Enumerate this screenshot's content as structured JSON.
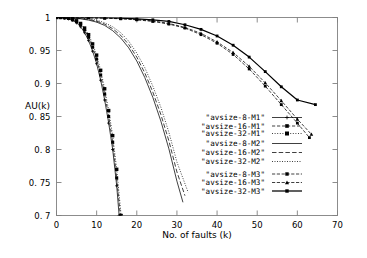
{
  "chart_data": {
    "type": "line",
    "title": "",
    "xlabel": "No. of faults (k)",
    "ylabel": "AU(k)",
    "xlim": [
      0,
      70
    ],
    "ylim": [
      0.7,
      1
    ],
    "xticks": [
      0,
      10,
      20,
      30,
      40,
      50,
      60,
      70
    ],
    "xtick_labels": [
      "0",
      "10",
      "20",
      "30",
      "40",
      "50",
      "60",
      "70"
    ],
    "yticks": [
      0.7,
      0.75,
      0.8,
      0.85,
      0.9,
      0.95,
      1
    ],
    "ytick_labels": [
      "0. 7",
      "0. 75",
      "0. 8",
      "0. 85",
      "0. 9",
      "0. 95",
      "1"
    ],
    "grid": false,
    "legend_position": "inside right-center",
    "series": [
      {
        "name": "\"avsize-8-M1\"",
        "style": "solid-thin-plus",
        "x": [
          0,
          1,
          2,
          3,
          4,
          5,
          6,
          7,
          8,
          9,
          10,
          11,
          12,
          13,
          14,
          15,
          15.6
        ],
        "y": [
          1.0,
          1.0,
          0.999,
          0.998,
          0.996,
          0.992,
          0.986,
          0.977,
          0.965,
          0.949,
          0.93,
          0.905,
          0.875,
          0.84,
          0.8,
          0.745,
          0.7
        ]
      },
      {
        "name": "\"avsize-16-M1\"",
        "style": "dashed-marker-square",
        "x": [
          0,
          1,
          2,
          3,
          4,
          5,
          6,
          7,
          8,
          9,
          10,
          11,
          12,
          13,
          14,
          15,
          15.9
        ],
        "y": [
          1.0,
          1.0,
          0.9995,
          0.9985,
          0.9965,
          0.9935,
          0.989,
          0.981,
          0.97,
          0.955,
          0.937,
          0.913,
          0.884,
          0.85,
          0.811,
          0.757,
          0.7
        ]
      },
      {
        "name": "\"avsize-32-M1\"",
        "style": "dotted-marker-square",
        "x": [
          0,
          1,
          2,
          3,
          4,
          5,
          6,
          7,
          8,
          9,
          10,
          11,
          12,
          13,
          14,
          15,
          16.1
        ],
        "y": [
          1.0,
          1.0,
          1.0,
          0.999,
          0.997,
          0.995,
          0.991,
          0.984,
          0.974,
          0.96,
          0.943,
          0.92,
          0.892,
          0.859,
          0.821,
          0.77,
          0.7
        ]
      },
      {
        "name": "\"avsize-8-M2\"",
        "style": "solid-thin",
        "x": [
          0,
          2,
          4,
          6,
          8,
          10,
          12,
          14,
          16,
          18,
          20,
          22,
          24,
          26,
          28,
          30,
          31.5
        ],
        "y": [
          1.0,
          1.0,
          0.999,
          0.998,
          0.996,
          0.993,
          0.988,
          0.98,
          0.969,
          0.954,
          0.934,
          0.909,
          0.879,
          0.843,
          0.801,
          0.752,
          0.72
        ]
      },
      {
        "name": "\"avsize-16-M2\"",
        "style": "dashed-long",
        "x": [
          0,
          2,
          4,
          6,
          8,
          10,
          12,
          14,
          16,
          18,
          20,
          22,
          24,
          26,
          28,
          30,
          32
        ],
        "y": [
          1.0,
          1.0,
          0.9995,
          0.9985,
          0.997,
          0.9945,
          0.99,
          0.983,
          0.973,
          0.959,
          0.94,
          0.916,
          0.887,
          0.853,
          0.813,
          0.766,
          0.73
        ]
      },
      {
        "name": "\"avsize-32-M2\"",
        "style": "dotted-fine",
        "x": [
          0,
          2,
          4,
          6,
          8,
          10,
          12,
          14,
          16,
          18,
          20,
          22,
          24,
          26,
          28,
          30,
          32.8
        ],
        "y": [
          1.0,
          1.0,
          1.0,
          0.999,
          0.998,
          0.996,
          0.992,
          0.986,
          0.977,
          0.964,
          0.946,
          0.924,
          0.896,
          0.864,
          0.826,
          0.781,
          0.735
        ]
      },
      {
        "name": "\"avsize-8-M3\"",
        "style": "dash-dot-marker",
        "x": [
          0,
          4,
          8,
          12,
          16,
          20,
          24,
          28,
          32,
          36,
          40,
          44,
          48,
          52,
          56,
          60,
          63
        ],
        "y": [
          1.0,
          1.0,
          0.9995,
          0.999,
          0.998,
          0.9965,
          0.994,
          0.99,
          0.984,
          0.974,
          0.961,
          0.944,
          0.922,
          0.896,
          0.868,
          0.84,
          0.818
        ]
      },
      {
        "name": "\"avsize-16-M3\"",
        "style": "dash-dot-marker-tri",
        "x": [
          0,
          4,
          8,
          12,
          16,
          20,
          24,
          28,
          32,
          36,
          40,
          44,
          48,
          52,
          56,
          60,
          63.5
        ],
        "y": [
          1.0,
          1.0,
          1.0,
          0.9993,
          0.9985,
          0.997,
          0.995,
          0.991,
          0.985,
          0.976,
          0.963,
          0.947,
          0.926,
          0.901,
          0.874,
          0.846,
          0.823
        ]
      },
      {
        "name": "\"avsize-32-M3\"",
        "style": "solid-thick-marker",
        "x": [
          0,
          4,
          8,
          12,
          16,
          20,
          24,
          28,
          32,
          36,
          40,
          44,
          48,
          52,
          56,
          60,
          64.5
        ],
        "y": [
          1.0,
          1.0,
          1.0,
          0.9997,
          0.999,
          0.998,
          0.9965,
          0.994,
          0.989,
          0.982,
          0.972,
          0.958,
          0.94,
          0.918,
          0.895,
          0.875,
          0.868
        ]
      }
    ]
  },
  "legend": {
    "entries": [
      {
        "label": "\"avsize-8-M1\""
      },
      {
        "label": "\"avsize-16-M1\""
      },
      {
        "label": "\"avsize-32-M1\""
      },
      {
        "label": "\"avsize-8-M2\""
      },
      {
        "label": "\"avsize-16-M2\""
      },
      {
        "label": "\"avsize-32-M2\""
      },
      {
        "label": "\"avsize-8-M3\""
      },
      {
        "label": "\"avsize-16-M3\""
      },
      {
        "label": "\"avsize-32-M3\""
      }
    ]
  },
  "colors": {
    "line": "#000000",
    "axis": "#808080",
    "background": "#ffffff"
  }
}
